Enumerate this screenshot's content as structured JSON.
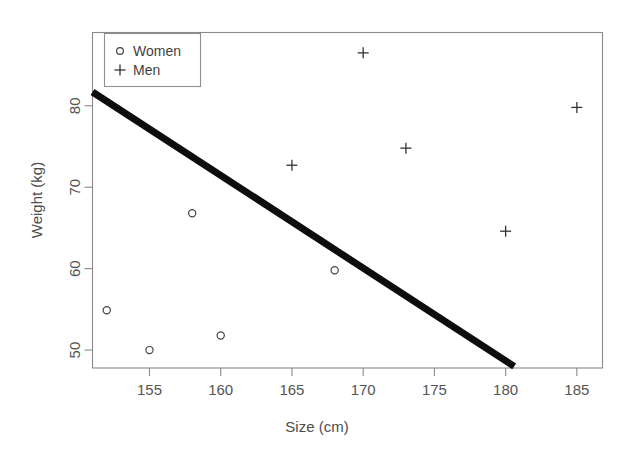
{
  "chart_data": {
    "type": "scatter",
    "title": "",
    "xlabel": "Size (cm)",
    "ylabel": "Weight (kg)",
    "xlim": [
      151.0,
      186.8
    ],
    "ylim": [
      47.8,
      89.0
    ],
    "xticks": [
      155,
      160,
      165,
      170,
      175,
      180,
      185
    ],
    "xtick_labels": [
      "155",
      "160",
      "165",
      "170",
      "175",
      "180",
      "185"
    ],
    "yticks": [
      50,
      60,
      70,
      80
    ],
    "ytick_labels": [
      "50",
      "60",
      "70",
      "80"
    ],
    "grid": false,
    "legend_position": "top-left",
    "series": [
      {
        "name": "Women",
        "marker": "circle",
        "color": "#444444",
        "points": [
          {
            "x": 152,
            "y": 54.9
          },
          {
            "x": 155,
            "y": 50.0
          },
          {
            "x": 158,
            "y": 66.8
          },
          {
            "x": 160,
            "y": 51.8
          },
          {
            "x": 168,
            "y": 59.8
          }
        ]
      },
      {
        "name": "Men",
        "marker": "plus",
        "color": "#333333",
        "points": [
          {
            "x": 165,
            "y": 72.7
          },
          {
            "x": 170,
            "y": 86.5
          },
          {
            "x": 173,
            "y": 74.8
          },
          {
            "x": 180,
            "y": 64.6
          },
          {
            "x": 185,
            "y": 79.8
          }
        ]
      }
    ],
    "trendline": {
      "name": "regression-line",
      "color": "#0d0d0d",
      "x_start": 151.0,
      "y_start": 81.7,
      "x_end": 180.6,
      "y_end": 48.0
    }
  },
  "legend": {
    "entries": [
      {
        "label": "Women",
        "marker": "circle"
      },
      {
        "label": "Men",
        "marker": "plus"
      }
    ]
  },
  "axes": {
    "x_title": "Size (cm)",
    "y_title": "Weight (kg)"
  }
}
